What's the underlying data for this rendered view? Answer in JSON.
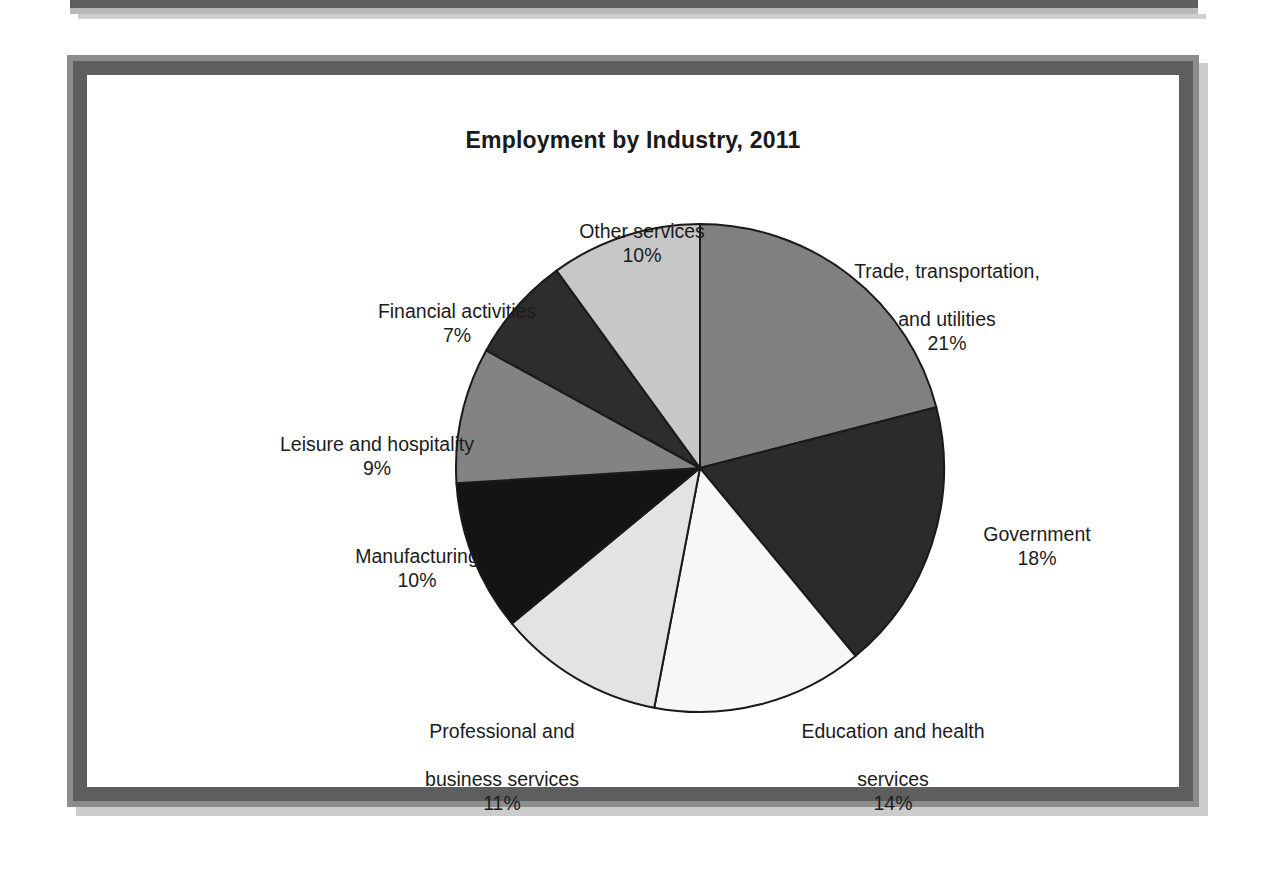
{
  "page": {
    "background": "#ffffff",
    "frame_color": "#5e5e5e",
    "frame_outer_color": "#8c8c8c"
  },
  "chart_data": {
    "type": "pie",
    "title": "Employment by Industry, 2011",
    "xlabel": "",
    "ylabel": "",
    "legend_position": "none",
    "value_unit": "%",
    "start_angle_deg": 0,
    "direction": "clockwise",
    "categories": [
      "Trade, transportation, and utilities",
      "Government",
      "Education and health services",
      "Professional and business services",
      "Manufacturing",
      "Leisure and hospitality",
      "Financial activities",
      "Other services"
    ],
    "values": [
      21,
      18,
      14,
      11,
      10,
      9,
      7,
      10
    ],
    "total": 100,
    "slices": [
      {
        "label": "Trade, transportation,\nand utilities",
        "label_line1": "Trade, transportation,",
        "label_line2": "and utilities",
        "value": 21,
        "value_label": "21%",
        "color": "#808080",
        "start_deg": 0,
        "end_deg": 75.6
      },
      {
        "label": "Government",
        "value": 18,
        "value_label": "18%",
        "color": "#2b2b2b",
        "start_deg": 75.6,
        "end_deg": 140.4
      },
      {
        "label": "Education and health\nservices",
        "label_line1": "Education and health",
        "label_line2": "services",
        "value": 14,
        "value_label": "14%",
        "color": "#f7f7f7",
        "start_deg": 140.4,
        "end_deg": 190.8
      },
      {
        "label": "Professional and\nbusiness services",
        "label_line1": "Professional and",
        "label_line2": "business services",
        "value": 11,
        "value_label": "11%",
        "color": "#e3e3e3",
        "start_deg": 190.8,
        "end_deg": 230.4
      },
      {
        "label": "Manufacturing",
        "value": 10,
        "value_label": "10%",
        "color": "#141414",
        "start_deg": 230.4,
        "end_deg": 266.4
      },
      {
        "label": "Leisure and hospitality",
        "value": 9,
        "value_label": "9%",
        "color": "#838383",
        "start_deg": 266.4,
        "end_deg": 298.8
      },
      {
        "label": "Financial activities",
        "value": 7,
        "value_label": "7%",
        "color": "#2d2d2d",
        "start_deg": 298.8,
        "end_deg": 324.0
      },
      {
        "label": "Other services",
        "value": 10,
        "value_label": "10%",
        "color": "#c7c7c7",
        "start_deg": 324.0,
        "end_deg": 360.0
      }
    ]
  },
  "labels": {
    "trade": {
      "line1": "Trade, transportation,",
      "line2": "and utilities",
      "pct": "21%"
    },
    "government": {
      "line1": "Government",
      "pct": "18%"
    },
    "education": {
      "line1": "Education and health",
      "line2": "services",
      "pct": "14%"
    },
    "professional": {
      "line1": "Professional and",
      "line2": "business services",
      "pct": "11%"
    },
    "manufacturing": {
      "line1": "Manufacturing",
      "pct": "10%"
    },
    "leisure": {
      "line1": "Leisure and hospitality",
      "pct": "9%"
    },
    "financial": {
      "line1": "Financial activities",
      "pct": "7%"
    },
    "other": {
      "line1": "Other services",
      "pct": "10%"
    }
  }
}
